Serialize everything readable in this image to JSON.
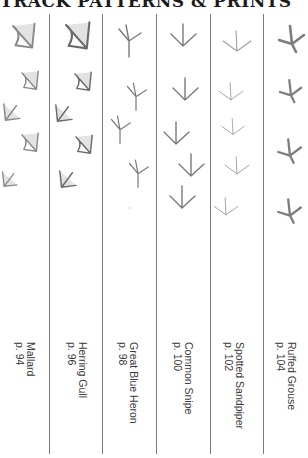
{
  "title": "TRACK PATTERNS & PRINTS",
  "columns": [
    {
      "name": "Mallard",
      "page": "p. 94",
      "track_type": "webbed",
      "color": "#8a8a8a"
    },
    {
      "name": "Herring Gull",
      "page": "p. 96",
      "track_type": "webbed",
      "color": "#6f6f6f"
    },
    {
      "name": "Great Blue Heron",
      "page": "p. 98",
      "track_type": "long-toed",
      "color": "#7a7a7a"
    },
    {
      "name": "Common Snipe",
      "page": "p. 100",
      "track_type": "thin-toed",
      "color": "#7a7a7a"
    },
    {
      "name": "Spotted Sandpiper",
      "page": "p. 102",
      "track_type": "thin-toed",
      "color": "#a0a0a0"
    },
    {
      "name": "Ruffed Grouse",
      "page": "p. 104",
      "track_type": "thick-toed",
      "color": "#7d7d7d"
    }
  ],
  "line_color": "#7a7a7a"
}
